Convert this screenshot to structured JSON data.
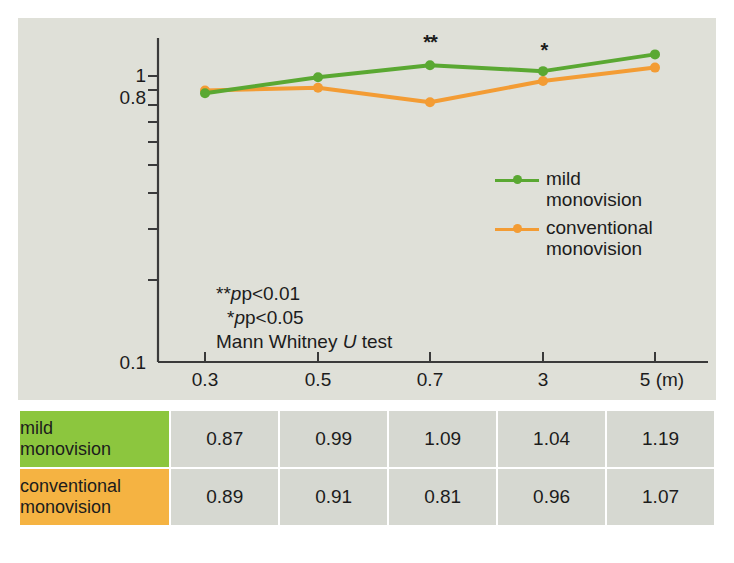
{
  "figure": {
    "panel_bg": "#dfe0d8",
    "page_bg": "#ffffff"
  },
  "chart_data": {
    "type": "line",
    "title": "",
    "xlabel": "",
    "ylabel": "",
    "x_unit_label": "(m)",
    "categories": [
      "0.3",
      "0.5",
      "0.7",
      "3",
      "5"
    ],
    "x_tick_labels": [
      "0.3",
      "0.5",
      "0.7",
      "3",
      "5 (m)"
    ],
    "y_tick_labels": [
      "1",
      "0.8",
      "0.1"
    ],
    "y_scale": "log",
    "ylim": [
      0.1,
      1.2
    ],
    "grid": false,
    "legend_position": "inside-right",
    "series": [
      {
        "name": "mild monovision",
        "label_line1": "mild",
        "label_line2": "monovision",
        "color": "#5aa832",
        "values": [
          0.87,
          0.99,
          1.09,
          1.04,
          1.19
        ]
      },
      {
        "name": "conventional monovision",
        "label_line1": "conventional",
        "label_line2": "monovision",
        "color": "#f39c34",
        "values": [
          0.89,
          0.91,
          0.81,
          0.96,
          1.07
        ]
      }
    ],
    "annotations": [
      {
        "text": "**",
        "at_category": "0.7",
        "meaning": "p<0.01"
      },
      {
        "text": "*",
        "at_category": "3",
        "meaning": "p<0.05"
      }
    ],
    "notes": {
      "line1_stars": "**",
      "line1_rest": "p<0.01",
      "line2_stars": "*",
      "line2_rest": "p<0.05",
      "line3_pre": "Mann Whitney ",
      "line3_italic": "U",
      "line3_post": " test"
    }
  },
  "table": {
    "rows": [
      {
        "header_line1": "mild",
        "header_line2": "monovision",
        "header_color": "#8cc63e",
        "values": [
          "0.87",
          "0.99",
          "1.09",
          "1.04",
          "1.19"
        ]
      },
      {
        "header_line1": "conventional",
        "header_line2": "monovision",
        "header_color": "#f5b342",
        "values": [
          "0.89",
          "0.91",
          "0.81",
          "0.96",
          "1.07"
        ]
      }
    ]
  }
}
